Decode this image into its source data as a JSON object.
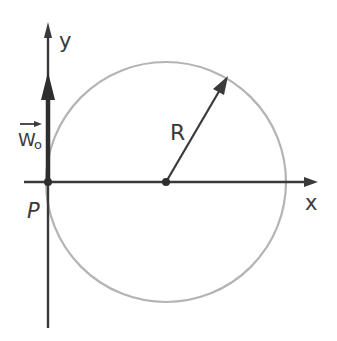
{
  "diagram": {
    "labels": {
      "y_axis": "y",
      "x_axis": "x",
      "origin": "P",
      "radius": "R",
      "velocity": "W",
      "velocity_subscript": "o"
    },
    "colors": {
      "axis": "#3a3a3a",
      "circle": "#b4b4b4",
      "vector": "#2e2e2e",
      "background": "#ffffff"
    },
    "geometry": {
      "origin": [
        48,
        182
      ],
      "circle_center": [
        166,
        182
      ],
      "circle_radius": 120,
      "radius_arrow_tip": [
        228,
        76
      ],
      "x_axis_range": [
        24,
        318
      ],
      "y_axis_range": [
        22,
        328
      ],
      "velocity_arrow_tip_y": 72
    }
  }
}
